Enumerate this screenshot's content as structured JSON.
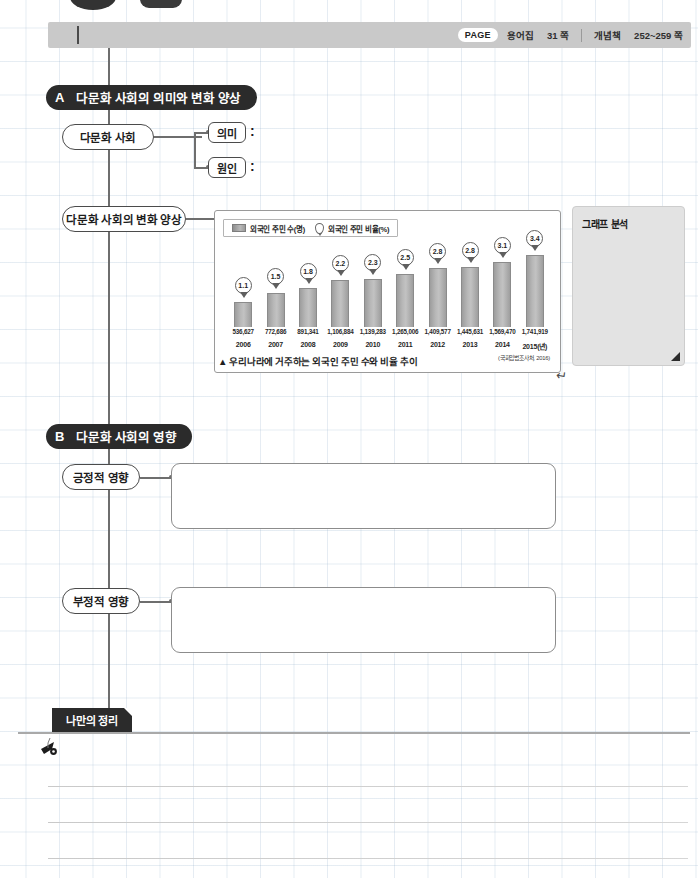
{
  "header": {
    "page_chip": "PAGE",
    "ref1_label": "용어집",
    "ref1_value": "31 쪽",
    "ref2_label": "개념책",
    "ref2_value": "252~259 쪽"
  },
  "sections": [
    {
      "letter": "A",
      "title": "다문화 사회의 의미와 변화 양상"
    },
    {
      "letter": "B",
      "title": "다문화 사회의 영향"
    }
  ],
  "labels": {
    "multicultural_society": "다문화 사회",
    "meaning": "의미",
    "cause": "원인",
    "colon": ":",
    "change_pattern": "다문화 사회의 변화 양상",
    "positive_effect": "긍정적 영향",
    "negative_effect": "부정적 영향"
  },
  "analysis_panel": {
    "title": "그래프 분석"
  },
  "note_section": {
    "tab_label": "나만의 정리"
  },
  "chart_caption": "▲ 우리나라에 거주하는 외국인 주민 수와 비율 추이",
  "chart_data": {
    "type": "bar",
    "title": "우리나라에 거주하는 외국인 주민 수와 비율 추이",
    "source": "(국회입법조사처, 2016)",
    "xlabel": "",
    "ylabel": "",
    "categories": [
      "2006",
      "2007",
      "2008",
      "2009",
      "2010",
      "2011",
      "2012",
      "2013",
      "2014",
      "2015(년)"
    ],
    "legend": [
      {
        "name": "외국인 주민 수(명)",
        "marker": "bar"
      },
      {
        "name": "외국인 주민 비율(%)",
        "marker": "pin"
      }
    ],
    "series": [
      {
        "name": "외국인 주민 수(명)",
        "unit": "명",
        "values": [
          536627,
          772686,
          891341,
          1106884,
          1139283,
          1265006,
          1409577,
          1445631,
          1569470,
          1741919
        ],
        "labels": [
          "536,627",
          "772,686",
          "891,341",
          "1,106,884",
          "1,139,283",
          "1,265,006",
          "1,409,577",
          "1,445,631",
          "1,569,470",
          "1,741,919"
        ]
      },
      {
        "name": "외국인 주민 비율(%)",
        "unit": "%",
        "values": [
          1.1,
          1.5,
          1.8,
          2.2,
          2.3,
          2.5,
          2.8,
          2.8,
          3.1,
          3.4
        ],
        "labels": [
          "1.1",
          "1.5",
          "1.8",
          "2.2",
          "2.3",
          "2.5",
          "2.8",
          "2.8",
          "3.1",
          "3.4"
        ]
      }
    ],
    "ylim": [
      0,
      1900000
    ],
    "grid": false,
    "legend_position": "top-left"
  },
  "colors": {
    "header_bar": "#c9c9c9",
    "section_header": "#2b2b2b",
    "bar_fill": "#b4b4b4",
    "panel_bg": "#e3e3e3",
    "grid_line": "#8caac8"
  }
}
